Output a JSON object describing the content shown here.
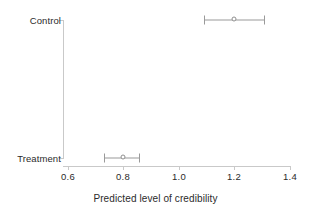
{
  "chart_data": {
    "type": "scatter",
    "title": "",
    "xlabel": "Predicted level of credibility",
    "ylabel": "",
    "xlim": [
      0.6,
      1.4
    ],
    "x_ticks": [
      0.6,
      0.8,
      1.0,
      1.2,
      1.4
    ],
    "x_tick_labels": [
      "0.6",
      "0.8",
      "1.0",
      "1.2",
      "1.4"
    ],
    "categories": [
      "Control",
      "Treatment"
    ],
    "grid": false,
    "legend": "none",
    "orientation": "horizontal",
    "series": [
      {
        "name": "Predicted level of credibility",
        "points": [
          {
            "category": "Control",
            "estimate": 1.2,
            "ci_low": 1.09,
            "ci_high": 1.31
          },
          {
            "category": "Treatment",
            "estimate": 0.8,
            "ci_low": 0.73,
            "ci_high": 0.86
          }
        ]
      }
    ],
    "colors": {
      "axis": "#c9c9c9",
      "marker": "#8f8f8f",
      "error_bar": "#9a9a9a",
      "text": "#2b2b2b",
      "background": "#ffffff"
    }
  },
  "axis": {
    "x_title": "Predicted level of credibility",
    "x_tick_0": "0.6",
    "x_tick_1": "0.8",
    "x_tick_2": "1.0",
    "x_tick_3": "1.2",
    "x_tick_4": "1.4",
    "y_cat_0": "Control",
    "y_cat_1": "Treatment"
  }
}
